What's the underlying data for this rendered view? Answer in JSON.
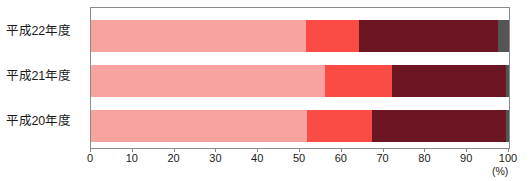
{
  "chart_data": {
    "type": "bar",
    "orientation": "horizontal",
    "stacked": true,
    "stacked_percent": true,
    "title": "",
    "subtitle": "",
    "xlabel": "",
    "ylabel": "",
    "unit_label": "(%)",
    "xlim": [
      0,
      100
    ],
    "xticks": [
      0,
      10,
      20,
      30,
      40,
      50,
      60,
      70,
      80,
      90,
      100
    ],
    "xtick_labels": [
      "0",
      "10",
      "20",
      "30",
      "40",
      "50",
      "60",
      "70",
      "80",
      "90",
      "100"
    ],
    "grid": false,
    "legend": "none",
    "categories": [
      "平成22年度",
      "平成21年度",
      "平成20年度"
    ],
    "series": [
      {
        "name": "segment-1",
        "color": "#f7a3a0",
        "values": [
          51.4,
          56.0,
          51.7
        ]
      },
      {
        "name": "segment-2",
        "color": "#fb4b45",
        "values": [
          12.7,
          16.0,
          15.5
        ]
      },
      {
        "name": "segment-3",
        "color": "#6b1622",
        "values": [
          33.3,
          27.3,
          32.1
        ]
      },
      {
        "name": "segment-4",
        "color": "#555555",
        "values": [
          2.6,
          0.7,
          0.7
        ]
      }
    ],
    "rows": [
      {
        "label": "平成22年度",
        "segments": [
          {
            "name": "segment-1",
            "value": 51.4,
            "color": "#f7a3a0"
          },
          {
            "name": "segment-2",
            "value": 12.7,
            "color": "#fb4b45"
          },
          {
            "name": "segment-3",
            "value": 33.3,
            "color": "#6b1622"
          },
          {
            "name": "segment-4",
            "value": 2.6,
            "color": "#555555"
          }
        ]
      },
      {
        "label": "平成21年度",
        "segments": [
          {
            "name": "segment-1",
            "value": 56.0,
            "color": "#f7a3a0"
          },
          {
            "name": "segment-2",
            "value": 16.0,
            "color": "#fb4b45"
          },
          {
            "name": "segment-3",
            "value": 27.3,
            "color": "#6b1622"
          },
          {
            "name": "segment-4",
            "value": 0.7,
            "color": "#555555"
          }
        ]
      },
      {
        "label": "平成20年度",
        "segments": [
          {
            "name": "segment-1",
            "value": 51.7,
            "color": "#f7a3a0"
          },
          {
            "name": "segment-2",
            "value": 15.5,
            "color": "#fb4b45"
          },
          {
            "name": "segment-3",
            "value": 32.1,
            "color": "#6b1622"
          },
          {
            "name": "segment-4",
            "value": 0.7,
            "color": "#555555"
          }
        ]
      }
    ],
    "colors": {
      "segment_1": "#f7a3a0",
      "segment_2": "#fb4b45",
      "segment_3": "#6b1622",
      "segment_4": "#555555",
      "axis": "#8a8a8a",
      "text": "#1a1a1a",
      "background": "#ffffff"
    }
  }
}
